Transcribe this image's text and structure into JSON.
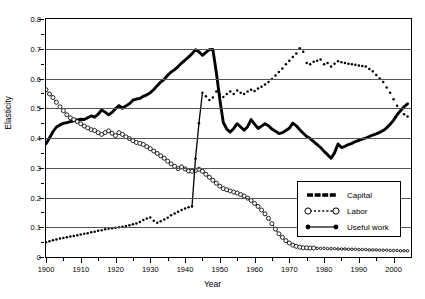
{
  "chart_data": {
    "type": "line",
    "title": "",
    "xlabel": "Year",
    "ylabel": "Elasticity",
    "xlim": [
      1900,
      2005
    ],
    "ylim": [
      0,
      0.8
    ],
    "grid": true,
    "legend_position": "inside-right-lower",
    "y_ticks": [
      0,
      0.1,
      0.2,
      0.3,
      0.4,
      0.5,
      0.6,
      0.7,
      0.8
    ],
    "y_tick_labels": [
      "0",
      "0.1",
      "0.2",
      "0.3",
      "0.4",
      "0.5",
      "0.6",
      "0.7",
      "0.8"
    ],
    "y_minor_ticks": [
      0.05,
      0.15,
      0.25,
      0.35,
      0.45,
      0.55,
      0.65,
      0.75
    ],
    "x_ticks": [
      1900,
      1910,
      1920,
      1930,
      1940,
      1950,
      1960,
      1970,
      1980,
      1990,
      2000
    ],
    "x_tick_labels": [
      "1900",
      "1910",
      "1920",
      "1930",
      "1940",
      "1950",
      "1960",
      "1970",
      "1980",
      "1990",
      "2000"
    ],
    "x_minor_ticks": [
      1905,
      1915,
      1925,
      1935,
      1945,
      1955,
      1965,
      1975,
      1985,
      1995
    ],
    "series": [
      {
        "name": "Capital",
        "style": "thick-solid-dotted",
        "color": "#000000",
        "x": [
          1900,
          1901,
          1902,
          1903,
          1904,
          1905,
          1906,
          1907,
          1908,
          1909,
          1910,
          1911,
          1912,
          1913,
          1914,
          1915,
          1916,
          1917,
          1918,
          1919,
          1920,
          1921,
          1922,
          1923,
          1924,
          1925,
          1926,
          1927,
          1928,
          1929,
          1930,
          1931,
          1932,
          1933,
          1934,
          1935,
          1936,
          1937,
          1938,
          1939,
          1940,
          1941,
          1942,
          1943,
          1944,
          1945,
          1946,
          1947,
          1948,
          1949,
          1950,
          1951,
          1952,
          1953,
          1954,
          1955,
          1956,
          1957,
          1958,
          1959,
          1960,
          1961,
          1962,
          1963,
          1964,
          1965,
          1966,
          1967,
          1968,
          1969,
          1970,
          1971,
          1972,
          1973,
          1974,
          1975,
          1976,
          1977,
          1978,
          1979,
          1980,
          1981,
          1982,
          1983,
          1984,
          1985,
          1986,
          1987,
          1988,
          1989,
          1990,
          1991,
          1992,
          1993,
          1994,
          1995,
          1996,
          1997,
          1998,
          1999,
          2000,
          2001,
          2002,
          2003,
          2004
        ],
        "y": [
          0.381,
          0.4,
          0.421,
          0.437,
          0.444,
          0.449,
          0.452,
          0.455,
          0.458,
          0.461,
          0.463,
          0.462,
          0.468,
          0.474,
          0.47,
          0.48,
          0.494,
          0.487,
          0.478,
          0.486,
          0.499,
          0.509,
          0.5,
          0.508,
          0.515,
          0.527,
          0.531,
          0.533,
          0.54,
          0.545,
          0.552,
          0.563,
          0.576,
          0.588,
          0.597,
          0.611,
          0.622,
          0.63,
          0.64,
          0.652,
          0.662,
          0.672,
          0.683,
          0.697,
          0.69,
          0.678,
          0.688,
          0.697,
          0.698,
          0.62,
          0.53,
          0.452,
          0.43,
          0.42,
          0.432,
          0.448,
          0.437,
          0.426,
          0.438,
          0.462,
          0.447,
          0.432,
          0.44,
          0.448,
          0.441,
          0.43,
          0.423,
          0.415,
          0.418,
          0.425,
          0.433,
          0.45,
          0.441,
          0.428,
          0.416,
          0.405,
          0.398,
          0.388,
          0.378,
          0.368,
          0.355,
          0.344,
          0.332,
          0.35,
          0.38,
          0.368,
          0.372,
          0.378,
          0.382,
          0.388,
          0.392,
          0.396,
          0.4,
          0.405,
          0.41,
          0.414,
          0.419,
          0.425,
          0.434,
          0.446,
          0.46,
          0.478,
          0.492,
          0.505,
          0.515
        ]
      },
      {
        "name": "Labor",
        "style": "dotted-open-circles",
        "color": "#000000",
        "x": [
          1900,
          1901,
          1902,
          1903,
          1904,
          1905,
          1906,
          1907,
          1908,
          1909,
          1910,
          1911,
          1912,
          1913,
          1914,
          1915,
          1916,
          1917,
          1918,
          1919,
          1920,
          1921,
          1922,
          1923,
          1924,
          1925,
          1926,
          1927,
          1928,
          1929,
          1930,
          1931,
          1932,
          1933,
          1934,
          1935,
          1936,
          1937,
          1938,
          1939,
          1940,
          1941,
          1942,
          1943,
          1944,
          1945,
          1946,
          1947,
          1948,
          1949,
          1950,
          1951,
          1952,
          1953,
          1954,
          1955,
          1956,
          1957,
          1958,
          1959,
          1960,
          1961,
          1962,
          1963,
          1964,
          1965,
          1966,
          1967,
          1968,
          1969,
          1970,
          1971,
          1972,
          1973,
          1974,
          1975,
          1976,
          1977,
          1978,
          1979,
          1980,
          1981,
          1982,
          1983,
          1984,
          1985,
          1986,
          1987,
          1988,
          1989,
          1990,
          1991,
          1992,
          1993,
          1994,
          1995,
          1996,
          1997,
          1998,
          1999,
          2000,
          2001,
          2002,
          2003,
          2004
        ],
        "y": [
          0.562,
          0.548,
          0.536,
          0.52,
          0.505,
          0.492,
          0.478,
          0.468,
          0.462,
          0.455,
          0.448,
          0.44,
          0.434,
          0.428,
          0.425,
          0.418,
          0.412,
          0.418,
          0.424,
          0.416,
          0.408,
          0.418,
          0.412,
          0.404,
          0.398,
          0.391,
          0.385,
          0.382,
          0.378,
          0.371,
          0.364,
          0.356,
          0.348,
          0.34,
          0.332,
          0.322,
          0.313,
          0.305,
          0.297,
          0.303,
          0.296,
          0.289,
          0.288,
          0.291,
          0.295,
          0.288,
          0.278,
          0.268,
          0.258,
          0.248,
          0.238,
          0.23,
          0.226,
          0.222,
          0.218,
          0.215,
          0.21,
          0.205,
          0.198,
          0.19,
          0.18,
          0.17,
          0.158,
          0.145,
          0.13,
          0.112,
          0.094,
          0.078,
          0.066,
          0.055,
          0.047,
          0.04,
          0.036,
          0.033,
          0.031,
          0.031,
          0.03,
          0.03,
          0.029,
          0.029,
          0.029,
          0.028,
          0.028,
          0.028,
          0.027,
          0.027,
          0.027,
          0.026,
          0.026,
          0.026,
          0.025,
          0.025,
          0.025,
          0.024,
          0.024,
          0.024,
          0.023,
          0.023,
          0.023,
          0.022,
          0.022,
          0.022,
          0.021,
          0.021,
          0.021
        ]
      },
      {
        "name": "Useful work",
        "style": "solid-small-dots",
        "color": "#000000",
        "x": [
          1900,
          1901,
          1902,
          1903,
          1904,
          1905,
          1906,
          1907,
          1908,
          1909,
          1910,
          1911,
          1912,
          1913,
          1914,
          1915,
          1916,
          1917,
          1918,
          1919,
          1920,
          1921,
          1922,
          1923,
          1924,
          1925,
          1926,
          1927,
          1928,
          1929,
          1930,
          1931,
          1932,
          1933,
          1934,
          1935,
          1936,
          1937,
          1938,
          1939,
          1940,
          1941,
          1942,
          1943,
          1944,
          1945,
          1946,
          1947,
          1948,
          1949,
          1950,
          1951,
          1952,
          1953,
          1954,
          1955,
          1956,
          1957,
          1958,
          1959,
          1960,
          1961,
          1962,
          1963,
          1964,
          1965,
          1966,
          1967,
          1968,
          1969,
          1970,
          1971,
          1972,
          1973,
          1974,
          1975,
          1976,
          1977,
          1978,
          1979,
          1980,
          1981,
          1982,
          1983,
          1984,
          1985,
          1986,
          1987,
          1988,
          1989,
          1990,
          1991,
          1992,
          1993,
          1994,
          1995,
          1996,
          1997,
          1998,
          1999,
          2000,
          2001,
          2002,
          2003,
          2004
        ],
        "y": [
          0.05,
          0.053,
          0.056,
          0.059,
          0.062,
          0.064,
          0.066,
          0.069,
          0.071,
          0.073,
          0.076,
          0.078,
          0.08,
          0.083,
          0.085,
          0.088,
          0.09,
          0.093,
          0.095,
          0.097,
          0.098,
          0.1,
          0.102,
          0.104,
          0.107,
          0.11,
          0.113,
          0.118,
          0.124,
          0.129,
          0.133,
          0.122,
          0.115,
          0.12,
          0.126,
          0.132,
          0.14,
          0.146,
          0.152,
          0.158,
          0.163,
          0.167,
          0.17,
          0.33,
          0.45,
          0.552,
          0.54,
          0.528,
          0.536,
          0.556,
          0.546,
          0.538,
          0.548,
          0.556,
          0.548,
          0.56,
          0.552,
          0.548,
          0.556,
          0.562,
          0.558,
          0.566,
          0.572,
          0.58,
          0.588,
          0.598,
          0.61,
          0.622,
          0.634,
          0.648,
          0.66,
          0.672,
          0.684,
          0.702,
          0.69,
          0.652,
          0.648,
          0.656,
          0.66,
          0.664,
          0.648,
          0.652,
          0.64,
          0.65,
          0.658,
          0.655,
          0.652,
          0.65,
          0.648,
          0.646,
          0.644,
          0.642,
          0.64,
          0.632,
          0.624,
          0.612,
          0.6,
          0.588,
          0.57,
          0.552,
          0.53,
          0.508,
          0.492,
          0.48,
          0.472
        ]
      }
    ]
  },
  "legend": {
    "items": [
      {
        "label": "Capital",
        "symbol": "thick-solid-line"
      },
      {
        "label": "Labor",
        "symbol": "dotted-line-open-circles"
      },
      {
        "label": "Useful work",
        "symbol": "solid-line-filled-dots"
      }
    ]
  }
}
